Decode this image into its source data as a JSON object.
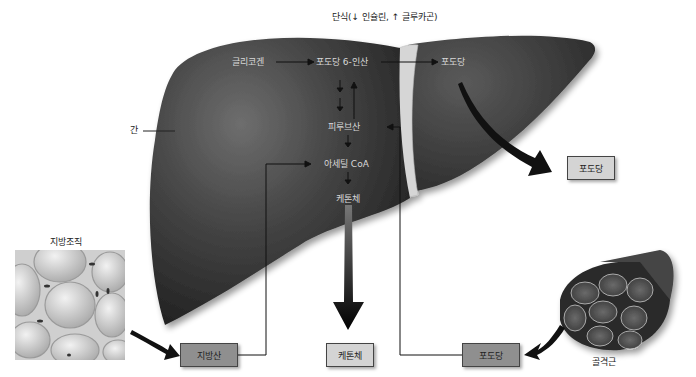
{
  "title": "단식(↓ 인슐린, ↑ 글루카곤)",
  "organ_labels": {
    "liver": "간",
    "adipose": "지방조직",
    "muscle": "골격근"
  },
  "pathway": {
    "glycogen": "글리코겐",
    "g6p": "포도당 6-인산",
    "glucose_in_liver": "포도당",
    "pyruvate": "피루브산",
    "acetyl_coa": "아세틸 CoA",
    "ketone_in_liver": "케톤체"
  },
  "boxes": {
    "glucose_out": "포도당",
    "fatty_acid": "지방산",
    "ketone_out": "케톤체",
    "glucose_muscle": "포도당"
  },
  "colors": {
    "liver": "#3a3a3a",
    "liver_highlight": "#6a6a6a",
    "ligament": "#d8d8d8",
    "box_light": "#d4d4d4",
    "box_dark": "#8f8f8f",
    "arrow": "#111111"
  }
}
